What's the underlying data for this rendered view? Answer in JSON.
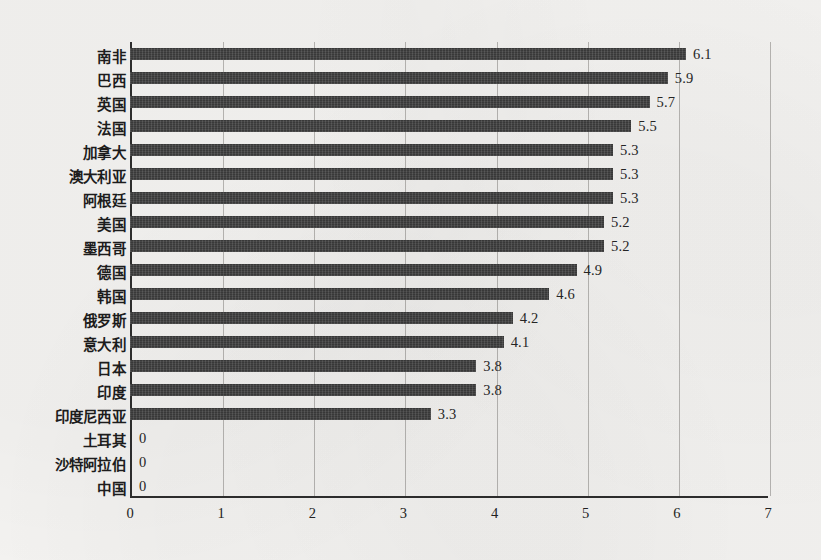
{
  "chart_data": {
    "type": "bar",
    "orientation": "horizontal",
    "title": "",
    "subtitle": "",
    "xlabel": "",
    "ylabel": "",
    "xlim": [
      0,
      7
    ],
    "ylim": null,
    "grid": true,
    "grid_axis": "x",
    "legend": null,
    "legend_position": "none",
    "bar_color": "#3a3a3a",
    "background_color": "#f4f3f1",
    "axis_color": "#2e2e2e",
    "gridline_color": "#b7b5b2",
    "xticks": [
      "0",
      "1",
      "2",
      "3",
      "4",
      "5",
      "6",
      "7"
    ],
    "xtick_values": [
      0,
      1,
      2,
      3,
      4,
      5,
      6,
      7
    ],
    "categories": [
      "南非",
      "巴西",
      "英国",
      "法国",
      "加拿大",
      "澳大利亚",
      "阿根廷",
      "美国",
      "墨西哥",
      "德国",
      "韩国",
      "俄罗斯",
      "意大利",
      "日本",
      "印度",
      "印度尼西亚",
      "土耳其",
      "沙特阿拉伯",
      "中国"
    ],
    "values": [
      6.1,
      5.9,
      5.7,
      5.5,
      5.3,
      5.3,
      5.3,
      5.2,
      5.2,
      4.9,
      4.6,
      4.2,
      4.1,
      3.8,
      3.8,
      3.3,
      0,
      0,
      0
    ],
    "data_labels": [
      "6.1",
      "5.9",
      "5.7",
      "5.5",
      "5.3",
      "5.3",
      "5.3",
      "5.2",
      "5.2",
      "4.9",
      "4.6",
      "4.2",
      "4.1",
      "3.8",
      "3.8",
      "3.3",
      "0",
      "0",
      "0"
    ],
    "points": [
      {
        "category": "南非",
        "value": 6.1,
        "label": "6.1"
      },
      {
        "category": "巴西",
        "value": 5.9,
        "label": "5.9"
      },
      {
        "category": "英国",
        "value": 5.7,
        "label": "5.7"
      },
      {
        "category": "法国",
        "value": 5.5,
        "label": "5.5"
      },
      {
        "category": "加拿大",
        "value": 5.3,
        "label": "5.3"
      },
      {
        "category": "澳大利亚",
        "value": 5.3,
        "label": "5.3"
      },
      {
        "category": "阿根廷",
        "value": 5.3,
        "label": "5.3"
      },
      {
        "category": "美国",
        "value": 5.2,
        "label": "5.2"
      },
      {
        "category": "墨西哥",
        "value": 5.2,
        "label": "5.2"
      },
      {
        "category": "德国",
        "value": 4.9,
        "label": "4.9"
      },
      {
        "category": "韩国",
        "value": 4.6,
        "label": "4.6"
      },
      {
        "category": "俄罗斯",
        "value": 4.2,
        "label": "4.2"
      },
      {
        "category": "意大利",
        "value": 4.1,
        "label": "4.1"
      },
      {
        "category": "日本",
        "value": 3.8,
        "label": "3.8"
      },
      {
        "category": "印度",
        "value": 3.8,
        "label": "3.8"
      },
      {
        "category": "印度尼西亚",
        "value": 3.3,
        "label": "3.3"
      },
      {
        "category": "土耳其",
        "value": 0,
        "label": "0"
      },
      {
        "category": "沙特阿拉伯",
        "value": 0,
        "label": "0"
      },
      {
        "category": "中国",
        "value": 0,
        "label": "0"
      }
    ]
  }
}
